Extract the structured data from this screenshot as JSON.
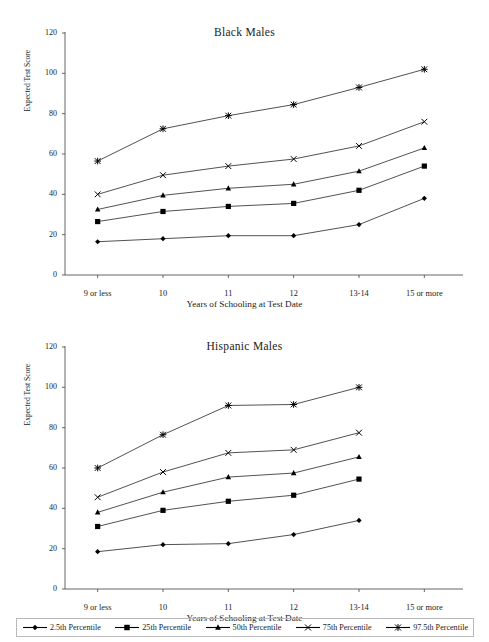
{
  "figure": {
    "xlabel": "Years of Schooling at Test Date",
    "ylabel": "Expected Test Score"
  },
  "legend": {
    "items": [
      {
        "label": "2.5th Percentile",
        "marker": "diamond-marker"
      },
      {
        "label": "25th Percentile",
        "marker": "square-marker"
      },
      {
        "label": "50th Percentile",
        "marker": "triangle-marker"
      },
      {
        "label": "75th Percentile",
        "marker": "x-marker"
      },
      {
        "label": "97.5th Percentile",
        "marker": "star-marker"
      }
    ]
  },
  "chart_data": [
    {
      "type": "line",
      "title": "Black Males",
      "xlabel": "Years of Schooling at Test Date",
      "ylabel": "Expected Test Score",
      "categories": [
        "9 or less",
        "10",
        "11",
        "12",
        "13-14",
        "15 or more"
      ],
      "yticks": [
        0,
        20,
        40,
        60,
        80,
        100,
        120
      ],
      "ylim": [
        0,
        120
      ],
      "grid": false,
      "legend_position": "bottom-shared",
      "series": [
        {
          "name": "2.5th Percentile",
          "marker": "diamond",
          "values": [
            16.5,
            18.0,
            19.5,
            19.5,
            25.0,
            38.0
          ]
        },
        {
          "name": "25th Percentile",
          "marker": "square",
          "values": [
            26.5,
            31.5,
            34.0,
            35.5,
            42.0,
            54.0
          ]
        },
        {
          "name": "50th Percentile",
          "marker": "triangle",
          "values": [
            32.5,
            39.5,
            43.0,
            45.0,
            51.5,
            63.0
          ]
        },
        {
          "name": "75th Percentile",
          "marker": "x",
          "values": [
            40.0,
            49.5,
            54.0,
            57.5,
            64.0,
            76.0
          ]
        },
        {
          "name": "97.5th Percentile",
          "marker": "star",
          "values": [
            56.5,
            72.5,
            79.0,
            84.5,
            93.0,
            102.0
          ]
        }
      ]
    },
    {
      "type": "line",
      "title": "Hispanic Males",
      "xlabel": "Years of Schooling at Test Date",
      "ylabel": "Expected Test Score",
      "categories": [
        "9 or less",
        "10",
        "11",
        "12",
        "13-14",
        "15 or more"
      ],
      "yticks": [
        0,
        20,
        40,
        60,
        80,
        100,
        120
      ],
      "ylim": [
        0,
        120
      ],
      "grid": false,
      "legend_position": "bottom-shared",
      "series": [
        {
          "name": "2.5th Percentile",
          "marker": "diamond",
          "values": [
            18.5,
            22.0,
            22.5,
            27.0,
            34.0,
            null
          ]
        },
        {
          "name": "25th Percentile",
          "marker": "square",
          "values": [
            31.0,
            39.0,
            43.5,
            46.5,
            54.5,
            null
          ]
        },
        {
          "name": "50th Percentile",
          "marker": "triangle",
          "values": [
            38.0,
            48.0,
            55.5,
            57.5,
            65.5,
            null
          ]
        },
        {
          "name": "75th Percentile",
          "marker": "x",
          "values": [
            45.5,
            58.0,
            67.5,
            69.0,
            77.5,
            null
          ]
        },
        {
          "name": "97.5th Percentile",
          "marker": "star",
          "values": [
            60.0,
            76.5,
            91.0,
            91.5,
            100.0,
            null
          ]
        }
      ]
    }
  ]
}
